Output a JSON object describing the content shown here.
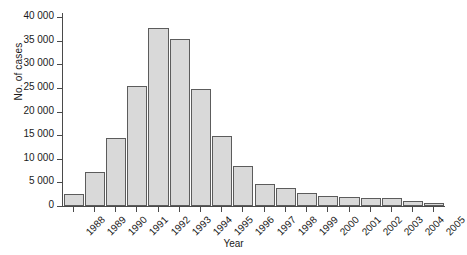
{
  "chart_data": {
    "type": "bar",
    "title": "",
    "xlabel": "Year",
    "ylabel": "No. of cases",
    "categories": [
      "1988",
      "1989",
      "1990",
      "1991",
      "1992",
      "1993",
      "1994",
      "1995",
      "1996",
      "1997",
      "1998",
      "1999",
      "2000",
      "2001",
      "2002",
      "2003",
      "2004",
      "2005"
    ],
    "values": [
      2500,
      7300,
      14500,
      25500,
      37600,
      35300,
      24800,
      14800,
      8400,
      4700,
      3900,
      2700,
      2200,
      2000,
      1800,
      1600,
      1100,
      700
    ],
    "ylim": [
      0,
      40000
    ],
    "ytick_values": [
      0,
      5000,
      10000,
      15000,
      20000,
      25000,
      30000,
      35000,
      40000
    ],
    "ytick_labels": [
      "0",
      "5 000",
      "10 000",
      "15 000",
      "20 000",
      "25 000",
      "30 000",
      "35 000",
      "40 000"
    ],
    "grid": false,
    "legend": null,
    "bar_color": "#d9d9d9",
    "bar_edge_color": "#5c5c5c",
    "axis_color": "#4a4a4a"
  }
}
